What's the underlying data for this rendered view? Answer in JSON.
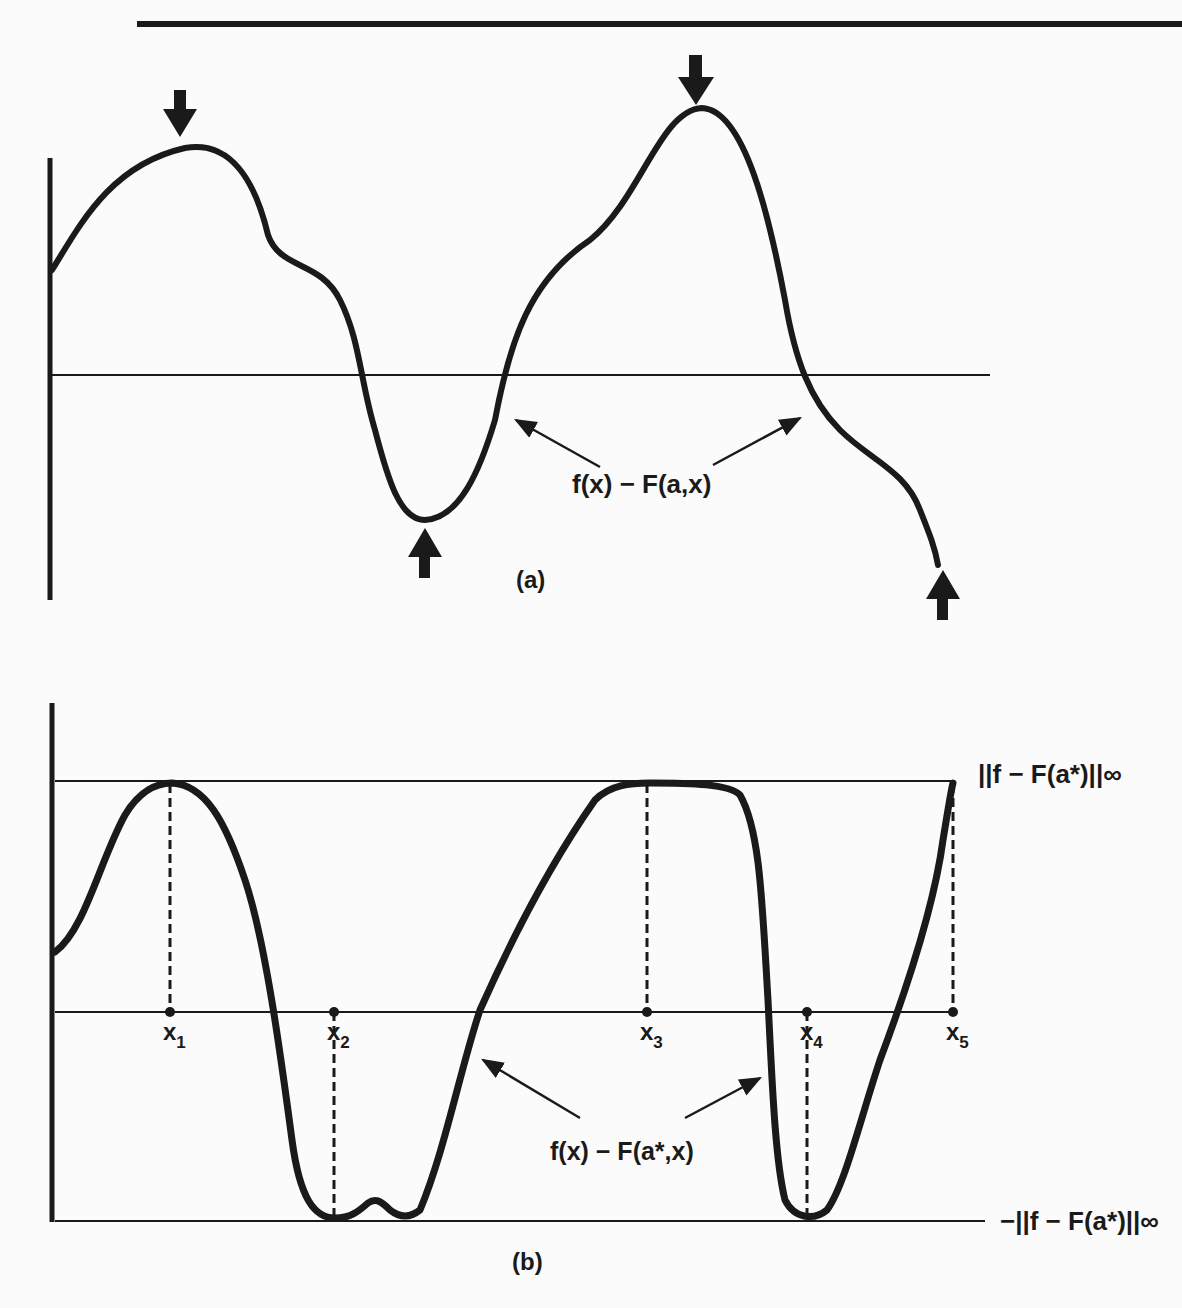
{
  "figure": {
    "colors": {
      "ink": "#1a1a1a",
      "background": "#fbfbfb"
    },
    "panel_a": {
      "label": "(a)",
      "curve_label": "f(x) − F(a,x)",
      "extrema_arrows": [
        {
          "direction": "down",
          "at": "local max 1"
        },
        {
          "direction": "up",
          "at": "local min 1"
        },
        {
          "direction": "down",
          "at": "local max 2"
        },
        {
          "direction": "up",
          "at": "right endpoint"
        }
      ]
    },
    "panel_b": {
      "label": "(b)",
      "curve_label": "f(x) − F(a*,x)",
      "upper_bound_label": "||f − F(a*)||∞",
      "lower_bound_label": "−||f − F(a*)||∞",
      "points": [
        {
          "name": "x",
          "sub": "1",
          "touches": "upper"
        },
        {
          "name": "x",
          "sub": "2",
          "touches": "lower"
        },
        {
          "name": "x",
          "sub": "3",
          "touches": "upper"
        },
        {
          "name": "x",
          "sub": "4",
          "touches": "lower"
        },
        {
          "name": "x",
          "sub": "5",
          "touches": "upper"
        }
      ]
    }
  }
}
